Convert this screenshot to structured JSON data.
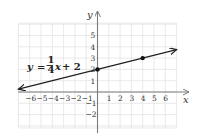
{
  "chart_data": {
    "type": "line",
    "title": "",
    "equation": {
      "lhs": "y",
      "equals": "=",
      "numerator": "1",
      "denominator": "4",
      "variable": "x",
      "rest": "+ 2",
      "text": "y = (1/4)x + 2"
    },
    "xlabel": "x",
    "ylabel": "y",
    "xlim": [
      -7,
      7
    ],
    "ylim": [
      -3,
      6
    ],
    "x_ticks": [
      "−6",
      "−5",
      "−4",
      "−3",
      "−2",
      "−1",
      "1",
      "2",
      "3",
      "4",
      "5",
      "6"
    ],
    "x_tick_values": [
      -6,
      -5,
      -4,
      -3,
      -2,
      -1,
      1,
      2,
      3,
      4,
      5,
      6
    ],
    "y_ticks": [
      "5",
      "4",
      "3",
      "2",
      "1",
      "−1",
      "−2"
    ],
    "y_tick_values": [
      5,
      4,
      3,
      2,
      1,
      -1,
      -2
    ],
    "grid": true,
    "series": [
      {
        "name": "y = 1/4 x + 2",
        "slope": 0.25,
        "intercept": 2,
        "x": [
          -7,
          7
        ],
        "y": [
          0.25,
          3.75
        ],
        "arrows_both_ends": true,
        "color": "#222222"
      }
    ],
    "points": [
      {
        "x": 0,
        "y": 2
      },
      {
        "x": 4,
        "y": 3
      }
    ]
  }
}
